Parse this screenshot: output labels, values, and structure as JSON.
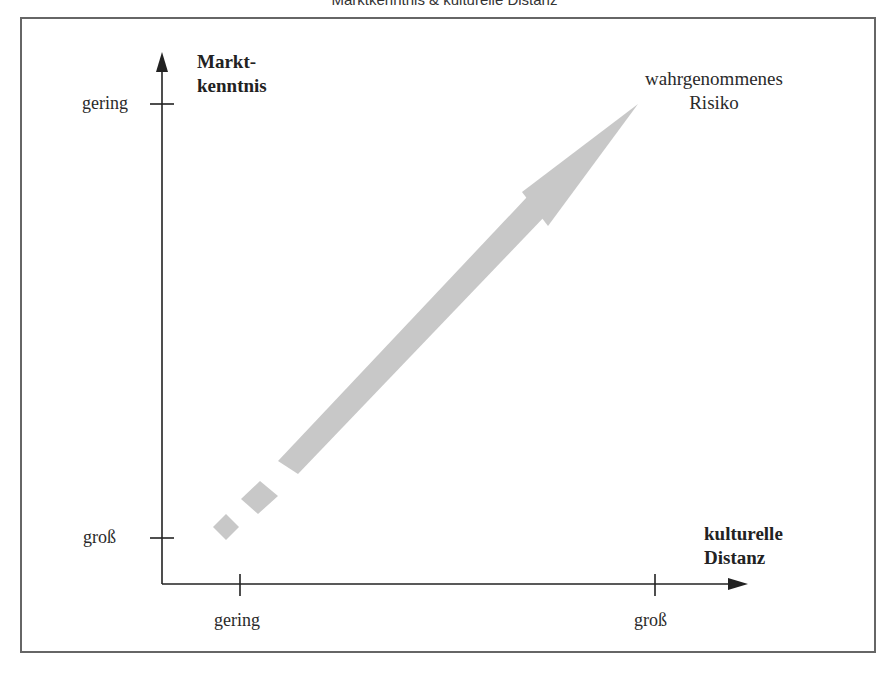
{
  "title": "Marktkenntnis & kulturelle Distanz",
  "y_axis": {
    "label_line1": "Markt-",
    "label_line2": "kenntnis",
    "tick_top": "gering",
    "tick_bottom": "groß"
  },
  "x_axis": {
    "label_line1": "kulturelle",
    "label_line2": "Distanz",
    "tick_left": "gering",
    "tick_right": "groß"
  },
  "arrow": {
    "label_line1": "wahrgenommenes",
    "label_line2": "Risiko",
    "color": "#c8c8c8"
  },
  "colors": {
    "axis": "#222222",
    "frame": "#666666",
    "arrow": "#c8c8c8"
  }
}
